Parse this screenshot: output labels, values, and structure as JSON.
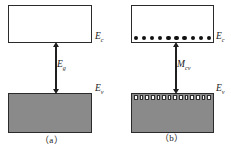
{
  "figure": {
    "colors": {
      "valence_fill": "#8a8a8a",
      "conduction_fill": "#ffffff",
      "outline": "#2b2b2b",
      "electron": "#111111",
      "hole_outline": "#303030",
      "arrow": "#1e1e1e",
      "background": "#ffffff"
    }
  },
  "panels": [
    {
      "id": "a",
      "caption": "（a）",
      "conduction_band": {
        "label": "E",
        "label_sub": "c",
        "fill": "empty"
      },
      "valence_band": {
        "label": "E",
        "label_sub": "v",
        "fill": "filled"
      },
      "transition": {
        "label": "E",
        "label_sub": "g",
        "arrow": "double-headed-vertical"
      },
      "electrons": 0,
      "holes": 0
    },
    {
      "id": "b",
      "caption": "（b）",
      "conduction_band": {
        "label": "E",
        "label_sub": "c",
        "fill": "empty"
      },
      "valence_band": {
        "label": "E",
        "label_sub": "v",
        "fill": "filled"
      },
      "transition": {
        "label": "M",
        "label_sub": "cv",
        "arrow": "double-headed-vertical"
      },
      "electrons": 10,
      "holes": 14
    }
  ]
}
